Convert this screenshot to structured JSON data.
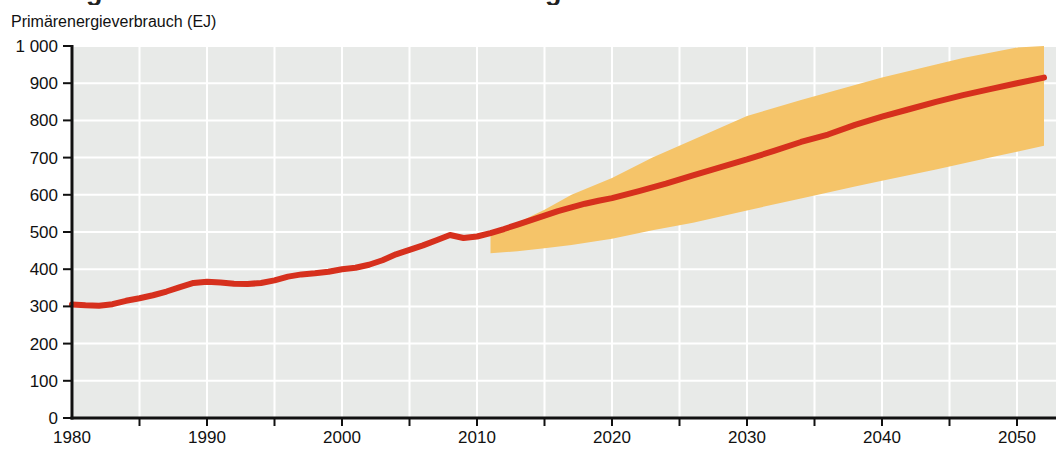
{
  "page": {
    "background": "#ffffff",
    "title_fragments": [
      "g",
      "g"
    ]
  },
  "chart_data": {
    "type": "line",
    "title": "",
    "xlabel": "",
    "ylabel": "Primärenergieverbrauch (EJ)",
    "xlim": [
      1980,
      2052.8
    ],
    "ylim": [
      0,
      1000
    ],
    "grid": "on",
    "legend_position": "none",
    "plot_bg_color": "#e8eae8",
    "grid_color": "#ffffff",
    "axis_color": "#111111",
    "line_color": "#d6301d",
    "band_color": "#f5c469",
    "x_tick_labels": [
      "1980",
      "1990",
      "2000",
      "2010",
      "2020",
      "2030",
      "2040",
      "2050"
    ],
    "x_tick_label_years": [
      1980,
      1990,
      2000,
      2010,
      2020,
      2030,
      2040,
      2050
    ],
    "x_minor_tick_step_years": 5,
    "y_tick_values": [
      0,
      100,
      200,
      300,
      400,
      500,
      600,
      700,
      800,
      900,
      1000
    ],
    "y_tick_labels": [
      "0",
      "100",
      "200",
      "300",
      "400",
      "500",
      "600",
      "700",
      "800",
      "900",
      "1 000"
    ],
    "series": [
      {
        "id": "primary-energy-consumption",
        "role": "historical-then-projection-central",
        "color": "#d6301d",
        "x": [
          1980,
          1981,
          1982,
          1983,
          1984,
          1985,
          1986,
          1987,
          1988,
          1989,
          1990,
          1991,
          1992,
          1993,
          1994,
          1995,
          1996,
          1997,
          1998,
          1999,
          2000,
          2001,
          2002,
          2003,
          2004,
          2005,
          2006,
          2007,
          2008,
          2009,
          2010,
          2011,
          2012,
          2013,
          2014,
          2015,
          2016,
          2017,
          2018,
          2019,
          2020,
          2022,
          2024,
          2026,
          2028,
          2030,
          2032,
          2034,
          2036,
          2038,
          2040,
          2042,
          2044,
          2046,
          2048,
          2050,
          2052
        ],
        "y": [
          305,
          303,
          302,
          306,
          315,
          322,
          330,
          340,
          352,
          363,
          366,
          364,
          361,
          360,
          363,
          370,
          380,
          386,
          389,
          393,
          400,
          404,
          412,
          424,
          440,
          452,
          464,
          478,
          492,
          484,
          488,
          497,
          508,
          520,
          532,
          544,
          556,
          566,
          576,
          584,
          591,
          610,
          630,
          652,
          674,
          695,
          718,
          742,
          762,
          788,
          810,
          830,
          850,
          868,
          884,
          900,
          915
        ]
      }
    ],
    "band": {
      "id": "projection-uncertainty-band",
      "color": "#f5c469",
      "x": [
        2011,
        2013,
        2015,
        2017,
        2020,
        2023,
        2026,
        2030,
        2034,
        2038,
        2040,
        2044,
        2046,
        2048,
        2050,
        2052
      ],
      "top": [
        497,
        525,
        560,
        600,
        645,
        700,
        748,
        812,
        855,
        895,
        915,
        950,
        968,
        982,
        996,
        1000
      ],
      "bottom": [
        443,
        448,
        456,
        465,
        482,
        505,
        525,
        558,
        590,
        622,
        638,
        668,
        684,
        700,
        716,
        732
      ]
    }
  }
}
